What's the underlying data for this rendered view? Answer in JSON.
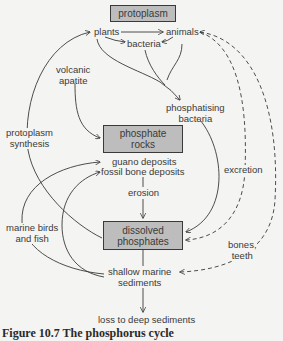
{
  "diagram": {
    "title": "The phosphorus cycle",
    "boxes": {
      "protoplasm": "protoplasm",
      "phosphate_rocks_line1": "phosphate",
      "phosphate_rocks_line2": "rocks",
      "dissolved_phosphates_line1": "dissolved",
      "dissolved_phosphates_line2": "phosphates"
    },
    "labels": {
      "plants": "plants",
      "animals": "animals",
      "bacteria": "bacteria",
      "volcanic_apatite_line1": "volcanic",
      "volcanic_apatite_line2": "apatite",
      "phosphatising_bacteria_line1": "phosphatising",
      "phosphatising_bacteria_line2": "bacteria",
      "protoplasm_synthesis_line1": "protoplasm",
      "protoplasm_synthesis_line2": "synthesis",
      "guano_deposits": "guano deposits",
      "fossil_bone_deposits": "fossil bone deposits",
      "erosion": "erosion",
      "excretion": "excretion",
      "marine_birds_line1": "marine birds",
      "marine_birds_line2": "and fish",
      "bones_teeth_line1": "bones,",
      "bones_teeth_line2": "teeth",
      "shallow_marine_line1": "shallow marine",
      "shallow_marine_line2": "sediments",
      "loss_deep": "loss to deep sediments"
    },
    "colors": {
      "box_fill": "#bdbdbd",
      "line": "#3a3a3a",
      "background": "#f4f4f2"
    }
  },
  "caption": {
    "number": "Figure 10.7",
    "text": "The phosphorus cycle"
  }
}
